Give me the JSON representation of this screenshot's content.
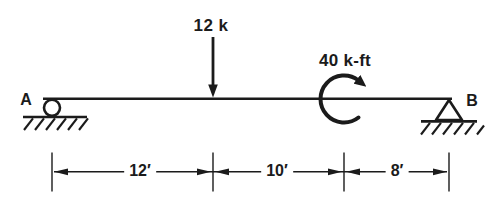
{
  "figure": {
    "colors": {
      "background": "#ffffff",
      "ink": "#1b1b1b"
    },
    "supports": {
      "left": {
        "label": "A",
        "type": "roller"
      },
      "right": {
        "label": "B",
        "type": "pin"
      }
    },
    "loads": {
      "point_load": {
        "label": "12 k",
        "magnitude": 12,
        "unit": "k",
        "direction": "down"
      },
      "moment": {
        "label": "40 k-ft",
        "magnitude": 40,
        "unit": "k-ft",
        "direction": "clockwise"
      }
    },
    "dimensions": {
      "segments": [
        {
          "label": "12′",
          "feet": 12
        },
        {
          "label": "10′",
          "feet": 10
        },
        {
          "label": "8′",
          "feet": 8
        }
      ]
    }
  }
}
